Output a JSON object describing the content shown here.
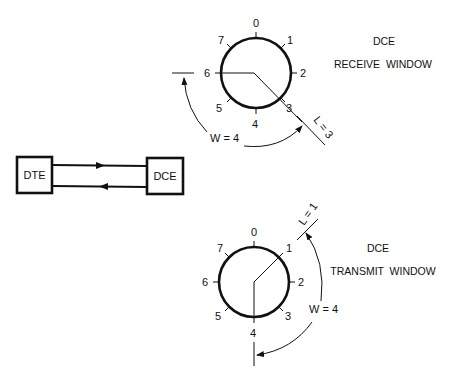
{
  "diagram": {
    "link": {
      "left_box": "DTE",
      "right_box": "DCE",
      "top_arrow_direction": "DTE-to-DCE",
      "bottom_arrow_direction": "DCE-to-DTE"
    },
    "receive_window": {
      "station": "DCE",
      "title": "RECEIVE  WINDOW",
      "sequence_numbers": [
        "0",
        "1",
        "2",
        "3",
        "4",
        "5",
        "6",
        "7"
      ],
      "window_label": "W = 4",
      "lower_edge_label": "L = 3",
      "upper_edge_position": "6"
    },
    "transmit_window": {
      "station": "DCE",
      "title": "TRANSMIT  WINDOW",
      "sequence_numbers": [
        "0",
        "1",
        "2",
        "3",
        "4",
        "5",
        "6",
        "7"
      ],
      "window_label": "W = 4",
      "lower_edge_label": "L = 1",
      "upper_edge_position": "4"
    },
    "colors": {
      "ink": "#111111",
      "background": "#ffffff"
    }
  }
}
